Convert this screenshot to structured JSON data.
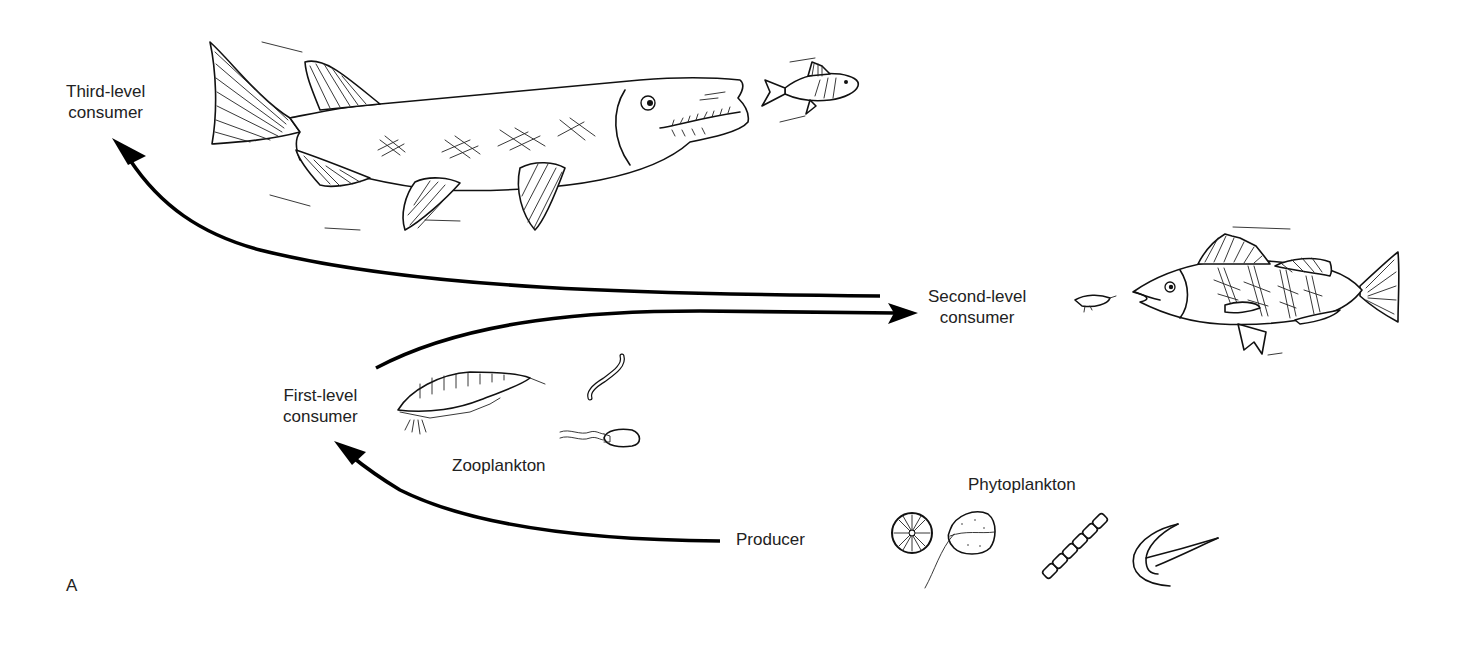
{
  "figure": {
    "panel_label": "A",
    "type": "aquatic food chain diagram"
  },
  "levels": {
    "third": {
      "line1": "Third-level",
      "line2": "consumer",
      "organism": "pike"
    },
    "second": {
      "line1": "Second-level",
      "line2": "consumer",
      "organism": "perch"
    },
    "first": {
      "line1": "First-level",
      "line2": "consumer",
      "group": "Zooplankton"
    },
    "producer": {
      "label": "Producer",
      "group": "Phytoplankton"
    }
  },
  "arrows": [
    {
      "from": "Producer",
      "to": "First-level consumer"
    },
    {
      "from": "First-level consumer",
      "to": "Second-level consumer"
    },
    {
      "from": "Second-level consumer",
      "to": "Third-level consumer"
    }
  ],
  "colors": {
    "ink": "#111111",
    "background": "#ffffff"
  }
}
